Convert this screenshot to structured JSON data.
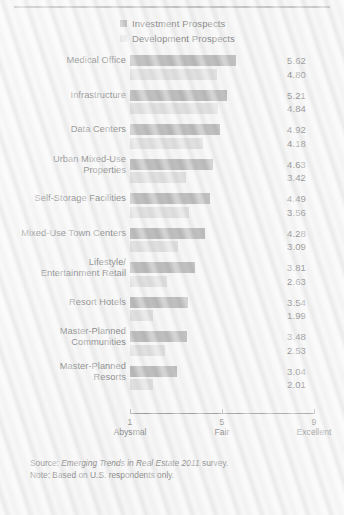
{
  "legend": {
    "items": [
      {
        "label": "Investment Prospects",
        "color": "#8c8c8c",
        "key": "investment"
      },
      {
        "label": "Development Prospects",
        "color": "#cbcbcb",
        "key": "development"
      }
    ]
  },
  "axis": {
    "ticks": [
      {
        "num": "1",
        "text": "Abysmal"
      },
      {
        "num": "5",
        "text": "Fair"
      },
      {
        "num": "9",
        "text": "Excellent"
      }
    ]
  },
  "footnote": {
    "source_prefix": "Source: ",
    "source_italic": "Emerging Trends in Real Estate 2011",
    "source_suffix": " survey.",
    "note": "Note: Based on U.S. respondents only."
  },
  "chart_data": {
    "type": "bar",
    "orientation": "horizontal",
    "title": "",
    "xlabel": "",
    "ylabel": "",
    "xlim": [
      1,
      9
    ],
    "grid": false,
    "legend_position": "top",
    "categories": [
      "Medical Office",
      "Infrastructure",
      "Data Centers",
      "Urban Mixed-Use\nProperties",
      "Self-Storage Facilities",
      "Mixed-Use Town Centers",
      "Lifestyle/\nEntertainment Retail",
      "Resort Hotels",
      "Master-Planned\nCommunities",
      "Master-Planned\nResorts"
    ],
    "series": [
      {
        "name": "Investment Prospects",
        "color": "#8c8c8c",
        "values": [
          5.62,
          5.21,
          4.92,
          4.63,
          4.49,
          4.28,
          3.81,
          3.54,
          3.48,
          3.04
        ]
      },
      {
        "name": "Development Prospects",
        "color": "#cbcbcb",
        "values": [
          4.8,
          4.84,
          4.18,
          3.42,
          3.56,
          3.09,
          2.63,
          1.99,
          2.53,
          2.01
        ]
      }
    ],
    "value_labels": [
      [
        "5.62",
        "4.80"
      ],
      [
        "5.21",
        "4.84"
      ],
      [
        "4.92",
        "4.18"
      ],
      [
        "4.63",
        "3.42"
      ],
      [
        "4.49",
        "3.56"
      ],
      [
        "4.28",
        "3.09"
      ],
      [
        "3.81",
        "2.63"
      ],
      [
        "3.54",
        "1.99"
      ],
      [
        "3.48",
        "2.53"
      ],
      [
        "3.04",
        "2.01"
      ]
    ],
    "tick_values": [
      1,
      5,
      9
    ],
    "tick_labels": [
      "Abysmal",
      "Fair",
      "Excellent"
    ]
  }
}
